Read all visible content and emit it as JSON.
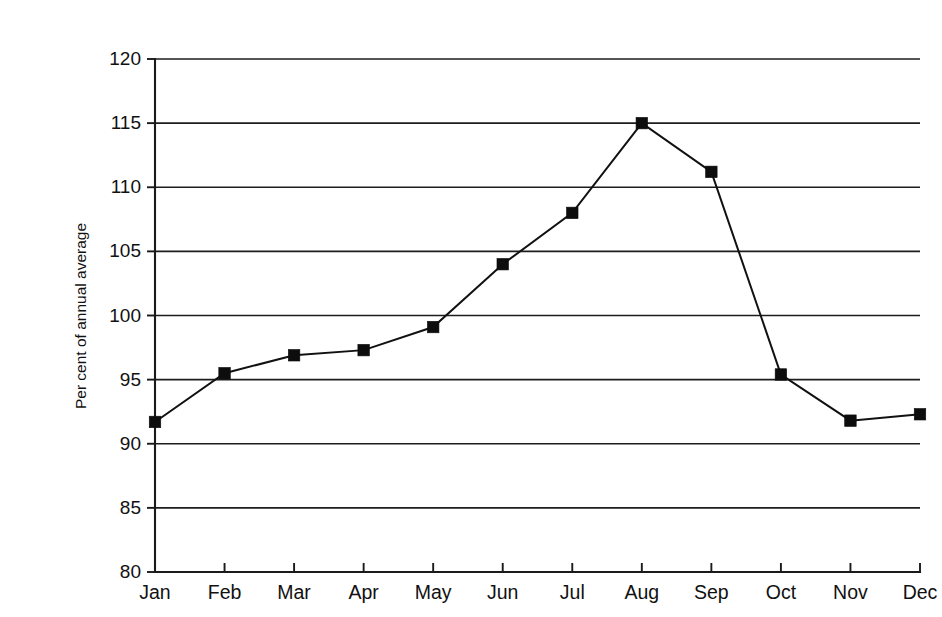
{
  "chart_data": {
    "type": "line",
    "title": "",
    "subtitle": "",
    "xlabel": "",
    "ylabel": "Per cent of annual average",
    "categories": [
      "Jan",
      "Feb",
      "Mar",
      "Apr",
      "May",
      "Jun",
      "Jul",
      "Aug",
      "Sep",
      "Oct",
      "Nov",
      "Dec"
    ],
    "values": [
      91.7,
      95.5,
      96.9,
      97.3,
      99.1,
      104.0,
      108.0,
      115.0,
      111.2,
      95.4,
      91.8,
      92.3
    ],
    "series": [
      {
        "name": "Per cent of annual average",
        "values": [
          91.7,
          95.5,
          96.9,
          97.3,
          99.1,
          104.0,
          108.0,
          115.0,
          111.2,
          95.4,
          91.8,
          92.3
        ]
      }
    ],
    "ylim": [
      80,
      120
    ],
    "yticks": [
      80,
      85,
      90,
      95,
      100,
      105,
      110,
      115,
      120
    ],
    "ytick_labels": [
      "80",
      "85",
      "90",
      "95",
      "100",
      "105",
      "110",
      "115",
      "120"
    ],
    "xtick_labels": [
      "Jan",
      "Feb",
      "Mar",
      "Apr",
      "May",
      "Jun",
      "Jul",
      "Aug",
      "Sep",
      "Oct",
      "Nov",
      "Dec"
    ],
    "grid": true,
    "grid_axis": "y",
    "legend": false,
    "legend_position": "none",
    "marker": "square",
    "marker_color": "#0d0d0d",
    "line_color": "#111111",
    "background_color": "#ffffff",
    "annotations": []
  },
  "axis": {
    "y_title": "Per cent of annual average"
  }
}
